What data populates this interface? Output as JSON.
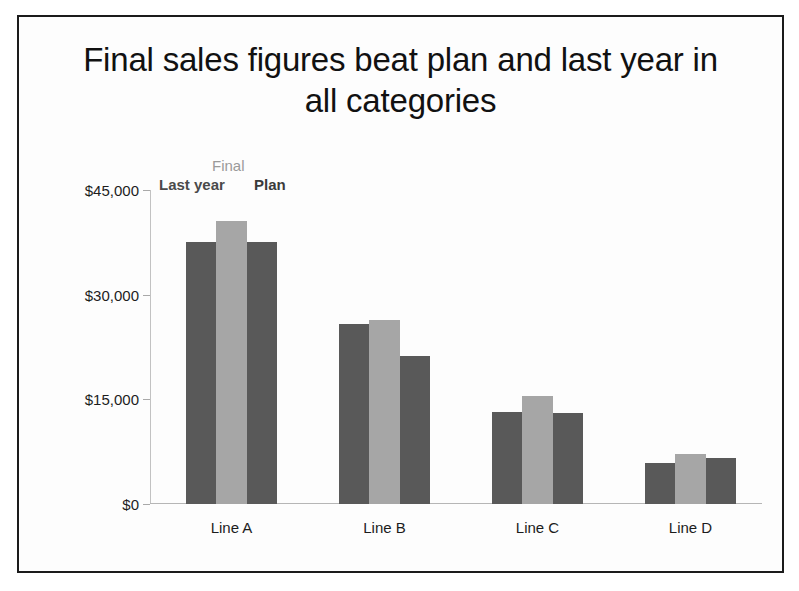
{
  "slide": {
    "title": "Final sales figures beat plan and last year in all categories"
  },
  "legend": {
    "final": "Final",
    "last_year": "Last year",
    "plan": "Plan"
  },
  "colors": {
    "series_last_year": "#595959",
    "series_final": "#a6a6a6",
    "series_plan": "#595959",
    "axis": "#b6b6b6",
    "text": "#1c1c1c",
    "frame": "#1b1b1b",
    "background": "#fdfdfd"
  },
  "axis": {
    "y_ticks": [
      "$0",
      "$15,000",
      "$30,000",
      "$45,000"
    ],
    "y_tick_values": [
      0,
      15000,
      30000,
      45000
    ],
    "x_categories": [
      "Line A",
      "Line B",
      "Line C",
      "Line D"
    ]
  },
  "chart_data": {
    "type": "bar",
    "title": "Final sales figures beat plan and last year in all categories",
    "xlabel": "",
    "ylabel": "",
    "ylim": [
      0,
      45000
    ],
    "yticks": [
      0,
      15000,
      30000,
      45000
    ],
    "ytick_labels": [
      "$0",
      "$15,000",
      "$30,000",
      "$45,000"
    ],
    "grid": false,
    "legend_position": "top-left",
    "categories": [
      "Line A",
      "Line B",
      "Line C",
      "Line D"
    ],
    "series": [
      {
        "name": "Last year",
        "color": "#595959",
        "values": [
          37500,
          25800,
          13200,
          5900
        ]
      },
      {
        "name": "Final",
        "color": "#a6a6a6",
        "values": [
          40500,
          26400,
          15500,
          7200
        ]
      },
      {
        "name": "Plan",
        "color": "#595959",
        "values": [
          37500,
          21200,
          13000,
          6600
        ]
      }
    ]
  }
}
